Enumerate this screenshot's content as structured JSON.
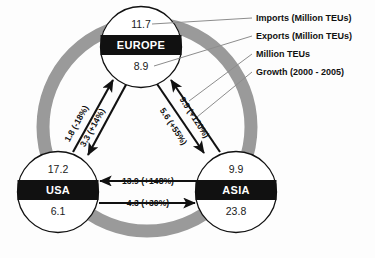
{
  "diagram": {
    "background_color": "#fdfdfd",
    "ring_color": "#9a9a9a",
    "node_bar_color": "#111111",
    "arrow_color": "#111111"
  },
  "nodes": [
    {
      "id": "europe",
      "name": "EUROPE",
      "imports": "11.7",
      "exports": "8.9"
    },
    {
      "id": "usa",
      "name": "USA",
      "imports": "17.2",
      "exports": "6.1"
    },
    {
      "id": "asia",
      "name": "ASIA",
      "imports": "9.9",
      "exports": "23.8"
    }
  ],
  "flows": [
    {
      "id": "usa-to-europe",
      "from": "USA",
      "to": "EUROPE",
      "volume": "1.8",
      "growth": "(-18%)",
      "label": "1.8 (-18%)"
    },
    {
      "id": "europe-to-usa",
      "from": "EUROPE",
      "to": "USA",
      "volume": "3.3",
      "growth": "(+14%)",
      "label": "3.3 (+14%)"
    },
    {
      "id": "europe-to-asia",
      "from": "EUROPE",
      "to": "ASIA",
      "volume": "5.6",
      "growth": "(+55%)",
      "label": "5.6 (+55%)"
    },
    {
      "id": "asia-to-europe",
      "from": "ASIA",
      "to": "EUROPE",
      "volume": "9.9",
      "growth": "(+120%)",
      "label": "9.9 (+120%)"
    },
    {
      "id": "asia-to-usa",
      "from": "ASIA",
      "to": "USA",
      "volume": "13.9",
      "growth": "(+148%)",
      "label": "13.9 (+148%)"
    },
    {
      "id": "usa-to-asia",
      "from": "USA",
      "to": "ASIA",
      "volume": "4.3",
      "growth": "(+30%)",
      "label": "4.3 (+30%)"
    }
  ],
  "legend": {
    "items": [
      {
        "id": "imports",
        "label": "Imports (Million TEUs)"
      },
      {
        "id": "exports",
        "label": "Exports (Million TEUs)"
      },
      {
        "id": "million-teus",
        "label": "Million TEUs"
      },
      {
        "id": "growth",
        "label": "Growth (2000 - 2005)"
      }
    ]
  }
}
